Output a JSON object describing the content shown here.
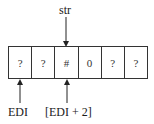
{
  "diagram": {
    "top_pointer": {
      "label": "str",
      "target_index": 2
    },
    "cells": [
      "?",
      "?",
      "#",
      "0",
      "?",
      "?"
    ],
    "bottom_pointers": [
      {
        "label": "EDI",
        "target_index": 0
      },
      {
        "label": "[EDI + 2]",
        "target_index": 2
      }
    ]
  }
}
